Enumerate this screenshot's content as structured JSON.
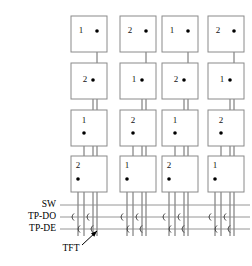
{
  "figure": {
    "background_color": "#ffffff",
    "cell_stroke_color": "#8a8a8a",
    "wire_color": "#555555",
    "bus_color": "#8a8a8a",
    "text_color": "#000000"
  },
  "matrix": {
    "rows": 4,
    "columns": 4,
    "cell_width": 36,
    "cell_height": 36,
    "column_x": [
      71,
      120,
      162,
      208
    ],
    "row_y": [
      16,
      63,
      110,
      156
    ],
    "cells": [
      [
        {
          "label": "1",
          "label_dx": 10,
          "label_dy": 15,
          "dot_dx": 26,
          "dot_dy": 15
        },
        {
          "label": "2",
          "label_dx": 10,
          "label_dy": 15,
          "dot_dx": 26,
          "dot_dy": 15
        },
        {
          "label": "1",
          "label_dx": 10,
          "label_dy": 15,
          "dot_dx": 26,
          "dot_dy": 15
        },
        {
          "label": "2",
          "label_dx": 10,
          "label_dy": 15,
          "dot_dx": 26,
          "dot_dy": 15
        }
      ],
      [
        {
          "label": "2",
          "label_dx": 14,
          "label_dy": 17,
          "dot_dx": 22,
          "dot_dy": 17
        },
        {
          "label": "1",
          "label_dx": 14,
          "label_dy": 17,
          "dot_dx": 22,
          "dot_dy": 17
        },
        {
          "label": "2",
          "label_dx": 14,
          "label_dy": 17,
          "dot_dx": 22,
          "dot_dy": 17
        },
        {
          "label": "1",
          "label_dx": 14,
          "label_dy": 17,
          "dot_dx": 22,
          "dot_dy": 17
        }
      ],
      [
        {
          "label": "1",
          "label_dx": 13,
          "label_dy": 11,
          "dot_dx": 13,
          "dot_dy": 23
        },
        {
          "label": "2",
          "label_dx": 13,
          "label_dy": 11,
          "dot_dx": 13,
          "dot_dy": 23
        },
        {
          "label": "1",
          "label_dx": 13,
          "label_dy": 11,
          "dot_dx": 13,
          "dot_dy": 23
        },
        {
          "label": "2",
          "label_dx": 13,
          "label_dy": 11,
          "dot_dx": 13,
          "dot_dy": 23
        }
      ],
      [
        {
          "label": "2",
          "label_dx": 7,
          "label_dy": 10,
          "dot_dx": 7,
          "dot_dy": 23
        },
        {
          "label": "1",
          "label_dx": 7,
          "label_dy": 10,
          "dot_dx": 7,
          "dot_dy": 23
        },
        {
          "label": "2",
          "label_dx": 7,
          "label_dy": 10,
          "dot_dx": 7,
          "dot_dy": 23
        },
        {
          "label": "1",
          "label_dx": 7,
          "label_dy": 10,
          "dot_dx": 7,
          "dot_dy": 23
        }
      ]
    ]
  },
  "wires": {
    "per_column_offsets": [
      7,
      13,
      22,
      26
    ],
    "sources": [
      {
        "row": 3,
        "offset_index": 0
      },
      {
        "row": 2,
        "offset_index": 1
      },
      {
        "row": 1,
        "offset_index": 2
      },
      {
        "row": 0,
        "offset_index": 3
      }
    ],
    "bottom_y": 236
  },
  "bus_lines": [
    {
      "id": "sw",
      "label": "SW",
      "y": 205,
      "x_start": 60,
      "x_end": 250,
      "label_x": 56
    },
    {
      "id": "tp-do",
      "label": "TP-DO",
      "y": 217,
      "x_start": 60,
      "x_end": 250,
      "label_x": 56
    },
    {
      "id": "tp-de",
      "label": "TP-DE",
      "y": 229,
      "x_start": 60,
      "x_end": 250,
      "label_x": 56
    }
  ],
  "transistors": {
    "note": "Each column has two TFTs on the TP-DO line and two on the TP-DE line",
    "on_tp_do_offsets": [
      7,
      22
    ],
    "on_tp_de_offsets": [
      13,
      26
    ]
  },
  "annotation": {
    "label": "TFT",
    "label_x": 71,
    "label_y": 249,
    "arrow_from_x": 82,
    "arrow_from_y": 245,
    "arrow_to_x": 97,
    "arrow_to_y": 231
  }
}
